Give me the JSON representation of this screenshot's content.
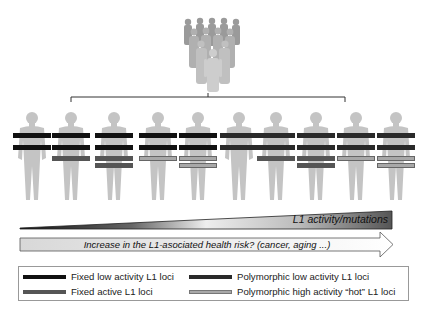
{
  "population": {
    "icon": "crowd-of-people-icon"
  },
  "figures": [
    {
      "bars": [
        "fixed_low",
        "fixed_low"
      ]
    },
    {
      "bars": [
        "fixed_low",
        "fixed_low",
        "fixed_active"
      ]
    },
    {
      "bars": [
        "fixed_low",
        "fixed_low",
        "fixed_active",
        "fixed_active"
      ]
    },
    {
      "bars": [
        "fixed_low",
        "fixed_low",
        "poly_high"
      ]
    },
    {
      "bars": [
        "fixed_low",
        "fixed_low",
        "poly_high",
        "poly_high"
      ]
    },
    {
      "bars": [
        "poly_low",
        "poly_low"
      ]
    },
    {
      "bars": [
        "poly_low",
        "poly_low",
        "fixed_active"
      ]
    },
    {
      "bars": [
        "poly_low",
        "poly_low",
        "fixed_active",
        "fixed_active"
      ]
    },
    {
      "bars": [
        "poly_low",
        "poly_low",
        "poly_high"
      ]
    },
    {
      "bars": [
        "poly_low",
        "poly_low",
        "poly_high",
        "poly_high"
      ]
    }
  ],
  "wedge": {
    "label": "L1 activity/mutations"
  },
  "arrow": {
    "label": "Increase in the L1-asociated health risk? (cancer, aging ...)"
  },
  "legend": {
    "items": [
      {
        "key": "fixed_low",
        "label": "Fixed low activity L1 loci",
        "color": "#111111"
      },
      {
        "key": "fixed_active",
        "label": "Fixed active L1 loci",
        "color": "#555555"
      },
      {
        "key": "poly_low",
        "label": "Polymorphic low activity L1 loci",
        "color": "#2a2a2a"
      },
      {
        "key": "poly_high",
        "label": "Polymorphic high activity “hot” L1 loci",
        "color": "#a8a8a8"
      }
    ]
  },
  "colors": {
    "fixed_low": "#111111",
    "fixed_active": "#555555",
    "poly_low": "#2a2a2a",
    "poly_high": "#a8a8a8",
    "body": "#c4c4c4"
  }
}
